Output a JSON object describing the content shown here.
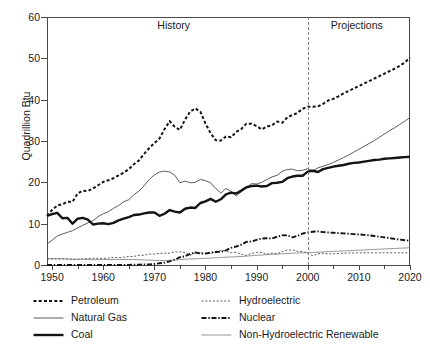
{
  "chart_data": {
    "type": "line",
    "title": "",
    "xlabel": "",
    "ylabel": "Quadrillion Btu",
    "xlim": [
      1949,
      2020
    ],
    "ylim": [
      0,
      60
    ],
    "xticks": [
      1950,
      1960,
      1970,
      1980,
      1990,
      2000,
      2010,
      2020
    ],
    "xtick_labels": [
      "1950",
      "1960",
      "1970",
      "1980",
      "1990",
      "2000",
      "2010",
      "2020"
    ],
    "yticks": [
      0,
      10,
      20,
      30,
      40,
      50,
      60
    ],
    "ytick_labels": [
      "0",
      "10",
      "20",
      "30",
      "40",
      "50",
      "60"
    ],
    "grid": false,
    "legend_position": "below",
    "annotations": [
      {
        "text": "History",
        "x": 1975,
        "y": 57.5
      },
      {
        "text": "Projections",
        "x": 2010,
        "y": 57.5
      },
      {
        "text": "divider",
        "x": 2000,
        "style": "dashed-vertical"
      }
    ],
    "history_projection_split": 2000,
    "x": [
      1949,
      1950,
      1951,
      1952,
      1953,
      1954,
      1955,
      1956,
      1957,
      1958,
      1959,
      1960,
      1961,
      1962,
      1963,
      1964,
      1965,
      1966,
      1967,
      1968,
      1969,
      1970,
      1971,
      1972,
      1973,
      1974,
      1975,
      1976,
      1977,
      1978,
      1979,
      1980,
      1981,
      1982,
      1983,
      1984,
      1985,
      1986,
      1987,
      1988,
      1989,
      1990,
      1991,
      1992,
      1993,
      1994,
      1995,
      1996,
      1997,
      1998,
      1999,
      2000,
      2001,
      2002,
      2003,
      2004,
      2005,
      2006,
      2007,
      2008,
      2009,
      2010,
      2011,
      2012,
      2013,
      2014,
      2015,
      2016,
      2017,
      2018,
      2019,
      2020
    ],
    "series": [
      {
        "name": "Petroleum",
        "style": "bold-dashed",
        "color": "#141414",
        "values": [
          11.9,
          13.3,
          14.4,
          14.7,
          15.3,
          15.3,
          17.3,
          18.0,
          17.9,
          18.5,
          19.3,
          20.1,
          20.5,
          21.0,
          21.7,
          22.3,
          23.2,
          24.4,
          25.3,
          26.9,
          28.3,
          29.5,
          30.6,
          32.9,
          34.8,
          33.4,
          32.7,
          35.2,
          37.1,
          37.9,
          37.1,
          34.2,
          31.9,
          30.2,
          30.1,
          31.1,
          30.9,
          32.2,
          32.9,
          34.2,
          34.2,
          33.6,
          32.8,
          33.5,
          33.8,
          34.7,
          34.4,
          35.7,
          36.3,
          36.8,
          37.8,
          38.3,
          38.3,
          38.4,
          39.0,
          39.8,
          40.2,
          40.8,
          41.5,
          42.1,
          42.7,
          43.3,
          43.9,
          44.5,
          45.1,
          45.7,
          46.3,
          46.9,
          47.5,
          48.2,
          49.0,
          50.2
        ]
      },
      {
        "name": "Natural Gas",
        "style": "thin-solid",
        "color": "#4a4a4a",
        "values": [
          5.1,
          6.0,
          7.0,
          7.5,
          7.9,
          8.3,
          9.0,
          9.6,
          10.2,
          10.7,
          11.7,
          12.4,
          12.9,
          13.7,
          14.4,
          15.3,
          15.8,
          17.0,
          17.9,
          19.2,
          20.7,
          21.8,
          22.5,
          22.7,
          22.5,
          21.7,
          19.9,
          20.3,
          19.9,
          20.0,
          20.7,
          20.4,
          19.9,
          18.5,
          17.4,
          18.5,
          17.8,
          16.7,
          17.7,
          18.6,
          19.7,
          19.6,
          20.0,
          20.7,
          21.3,
          21.7,
          22.7,
          23.1,
          23.2,
          22.8,
          22.9,
          23.3,
          22.8,
          23.5,
          23.9,
          24.3,
          24.8,
          25.4,
          26.0,
          26.6,
          27.3,
          28.0,
          28.7,
          29.4,
          30.1,
          30.9,
          31.7,
          32.5,
          33.2,
          34.0,
          34.8,
          35.7
        ]
      },
      {
        "name": "Coal",
        "style": "thick-solid",
        "color": "#141414",
        "values": [
          11.9,
          12.3,
          12.6,
          11.3,
          11.4,
          10.0,
          11.2,
          11.4,
          11.0,
          9.8,
          10.0,
          10.1,
          9.9,
          10.2,
          10.8,
          11.2,
          11.6,
          12.1,
          12.2,
          12.5,
          12.7,
          12.7,
          11.9,
          12.4,
          13.3,
          12.9,
          12.7,
          13.6,
          13.9,
          13.8,
          15.0,
          15.4,
          16.0,
          15.3,
          15.9,
          17.1,
          17.5,
          17.3,
          18.0,
          18.8,
          19.1,
          19.2,
          19.0,
          19.1,
          19.8,
          19.9,
          20.1,
          21.0,
          21.4,
          21.6,
          21.6,
          22.6,
          22.8,
          22.5,
          23.2,
          23.5,
          23.8,
          24.0,
          24.2,
          24.5,
          24.7,
          24.8,
          25.0,
          25.2,
          25.4,
          25.5,
          25.7,
          25.8,
          25.9,
          26.0,
          26.1,
          26.2
        ]
      },
      {
        "name": "Hydroelectric",
        "style": "thin-dotted",
        "color": "#4a4a4a",
        "values": [
          1.42,
          1.44,
          1.45,
          1.5,
          1.44,
          1.39,
          1.36,
          1.49,
          1.56,
          1.63,
          1.59,
          1.61,
          1.66,
          1.82,
          1.77,
          1.87,
          2.06,
          2.07,
          2.35,
          2.35,
          2.65,
          2.63,
          2.82,
          2.86,
          2.86,
          3.18,
          3.16,
          2.98,
          2.33,
          2.94,
          2.93,
          2.9,
          2.76,
          3.27,
          3.53,
          3.39,
          2.97,
          3.07,
          2.63,
          2.33,
          2.84,
          3.05,
          3.02,
          2.62,
          2.89,
          2.68,
          3.21,
          3.59,
          3.64,
          3.3,
          3.27,
          2.81,
          2.24,
          2.69,
          2.82,
          2.69,
          2.7,
          2.8,
          2.85,
          2.9,
          2.92,
          2.95,
          2.95,
          2.95,
          2.95,
          2.95,
          2.95,
          2.95,
          2.95,
          2.95,
          2.95,
          2.95
        ]
      },
      {
        "name": "Nuclear",
        "style": "dash-dot",
        "color": "#141414",
        "values": [
          0.0,
          0.0,
          0.0,
          0.0,
          0.0,
          0.0,
          0.0,
          0.0,
          0.0,
          0.0,
          0.0,
          0.01,
          0.02,
          0.03,
          0.04,
          0.04,
          0.04,
          0.06,
          0.09,
          0.14,
          0.15,
          0.24,
          0.41,
          0.58,
          0.91,
          1.27,
          1.9,
          2.11,
          2.7,
          3.02,
          2.78,
          2.74,
          3.01,
          3.13,
          3.2,
          3.55,
          4.15,
          4.47,
          4.91,
          5.59,
          5.68,
          6.1,
          6.42,
          6.48,
          6.41,
          6.84,
          7.18,
          7.17,
          6.68,
          7.07,
          7.61,
          7.86,
          8.03,
          8.14,
          7.96,
          7.88,
          7.8,
          7.72,
          7.64,
          7.56,
          7.48,
          7.4,
          7.3,
          7.18,
          7.02,
          6.85,
          6.68,
          6.5,
          6.32,
          6.14,
          6.0,
          5.9
        ]
      },
      {
        "name": "Non-Hydroelectric Renewable",
        "style": "hairline-solid",
        "color": "#6a6a6a",
        "values": [
          1.55,
          1.56,
          1.54,
          1.5,
          1.45,
          1.4,
          1.42,
          1.4,
          1.32,
          1.28,
          1.3,
          1.32,
          1.31,
          1.32,
          1.33,
          1.34,
          1.33,
          1.32,
          1.28,
          1.23,
          1.18,
          1.12,
          1.08,
          1.1,
          1.15,
          1.2,
          1.3,
          1.4,
          1.45,
          1.5,
          1.55,
          1.62,
          1.68,
          1.75,
          1.82,
          1.9,
          1.95,
          2.0,
          2.05,
          2.15,
          2.25,
          2.35,
          2.42,
          2.5,
          2.58,
          2.65,
          2.72,
          2.8,
          2.86,
          2.9,
          2.95,
          3.0,
          3.05,
          3.1,
          3.16,
          3.22,
          3.28,
          3.34,
          3.4,
          3.46,
          3.52,
          3.58,
          3.64,
          3.7,
          3.76,
          3.82,
          3.88,
          3.94,
          4.0,
          4.06,
          4.12,
          4.18
        ]
      }
    ]
  },
  "axis": {
    "ylabel_title": "Quadrillion Btu"
  },
  "annotations": {
    "history": "History",
    "projections": "Projections"
  },
  "legend": {
    "items": [
      {
        "label": "Petroleum",
        "style": "bold-dashed"
      },
      {
        "label": "Hydroelectric",
        "style": "thin-dotted"
      },
      {
        "label": "Natural Gas",
        "style": "thin-solid"
      },
      {
        "label": "Nuclear",
        "style": "dash-dot"
      },
      {
        "label": "Coal",
        "style": "thick-solid"
      },
      {
        "label": "Non-Hydroelectric Renewable",
        "style": "hairline-solid"
      }
    ]
  }
}
